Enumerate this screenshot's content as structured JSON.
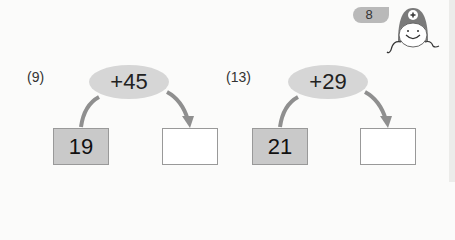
{
  "header": {
    "page_number": "8",
    "mascot_icon": "plus-mascot-icon"
  },
  "problems": [
    {
      "label": "(9)",
      "operation": "+45",
      "start_value": "19",
      "answer": ""
    },
    {
      "label": "(13)",
      "operation": "+29",
      "start_value": "21",
      "answer": ""
    }
  ],
  "colors": {
    "ellipse": "#d6d6d6",
    "filled_box": "#c9c9c9",
    "arrow": "#8f8f8f",
    "badge": "#b9b9b9"
  }
}
